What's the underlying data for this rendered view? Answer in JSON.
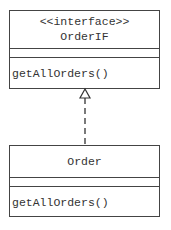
{
  "interface": {
    "stereotype": "<<interface>>",
    "name": "OrderIF",
    "attributes": [],
    "methods": [
      "getAllOrders()"
    ]
  },
  "class": {
    "name": "Order",
    "attributes": [],
    "methods": [
      "getAllOrders()"
    ]
  },
  "relationship": {
    "type": "realization",
    "from": "Order",
    "to": "OrderIF",
    "line_style": "dashed",
    "arrowhead": "hollow-triangle"
  }
}
